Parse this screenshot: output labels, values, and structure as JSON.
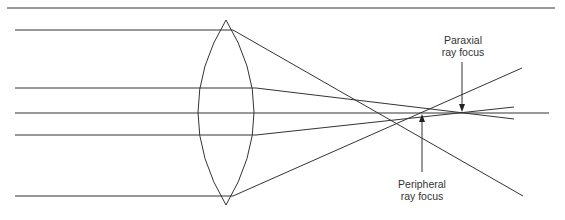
{
  "diagram": {
    "type": "optics-spherical-aberration",
    "labels": {
      "paraxial_line1": "Paraxial",
      "paraxial_line2": "ray focus",
      "peripheral_line1": "Peripheral",
      "peripheral_line2": "ray focus"
    },
    "colors": {
      "line": "#333333",
      "background": "#ffffff"
    }
  }
}
